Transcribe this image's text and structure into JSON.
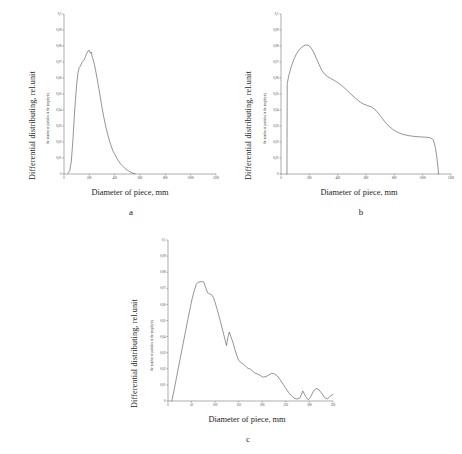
{
  "figure": {
    "background": "#ffffff",
    "line_color": "#3c3c3c",
    "axis_color": "#4a4a4a"
  },
  "panels": [
    {
      "id": "a",
      "letter": "a",
      "outer_ylabel": "Differential distributing, rel.unit",
      "outer_xlabel": "Diameter of piece, mm",
      "inner_ylabel": "the number of particles in the megabyte)"
    },
    {
      "id": "b",
      "letter": "b",
      "outer_ylabel": "Differential distributing, rel.unit",
      "outer_xlabel": "Diameter of piece, mm",
      "inner_ylabel": "the number of particles in the megabyte)"
    },
    {
      "id": "c",
      "letter": "c",
      "outer_ylabel": "Differential distributing, rel.unit",
      "outer_xlabel": "Diameter of piece, mm",
      "inner_ylabel": "the number of particles in the megabyte)"
    }
  ],
  "chart_data": [
    {
      "type": "line",
      "id": "a",
      "title": "",
      "xlabel": "Diameter of piece, mm",
      "ylabel": "Differential distributing, rel.unit",
      "xlim": [
        0,
        1200
      ],
      "ylim": [
        0,
        0.1
      ],
      "xticks": [
        0,
        200,
        400,
        600,
        800,
        1000,
        1200
      ],
      "xticklabels": [
        "0",
        "200",
        "400",
        "600",
        "800",
        "1000",
        "1200"
      ],
      "yticks": [
        0,
        0.01,
        0.02,
        0.03,
        0.04,
        0.05,
        0.06,
        0.07,
        0.08,
        0.09,
        0.1
      ],
      "yticklabels": [
        "0",
        "0,01",
        "0,02",
        "0,03",
        "0,04",
        "0,05",
        "0,06",
        "0,07",
        "0,08",
        "0,09",
        "0,1"
      ],
      "grid": false,
      "legend": false,
      "x": [
        30,
        45,
        58,
        70,
        80,
        90,
        100,
        110,
        120,
        130,
        140,
        150,
        160,
        170,
        180,
        190,
        200,
        208,
        215,
        222,
        230,
        240,
        250,
        262,
        275,
        288,
        300,
        315,
        330,
        345,
        360,
        375,
        390,
        405,
        420,
        440,
        460,
        480,
        500,
        520,
        540,
        560
      ],
      "y": [
        0.0005,
        0.002,
        0.008,
        0.021,
        0.034,
        0.046,
        0.056,
        0.063,
        0.0665,
        0.0675,
        0.0695,
        0.0705,
        0.0715,
        0.0735,
        0.0755,
        0.077,
        0.0772,
        0.0755,
        0.0762,
        0.0735,
        0.0715,
        0.0685,
        0.0645,
        0.0595,
        0.0535,
        0.0475,
        0.0415,
        0.0352,
        0.0295,
        0.0248,
        0.0205,
        0.0168,
        0.0138,
        0.0118,
        0.0095,
        0.007,
        0.0052,
        0.0036,
        0.0024,
        0.0014,
        0.0006,
        0.0002
      ]
    },
    {
      "type": "line",
      "id": "b",
      "title": "",
      "xlabel": "Diameter of piece, mm",
      "ylabel": "Differential distributing, rel.unit",
      "xlim": [
        0,
        1200
      ],
      "ylim": [
        0,
        0.1
      ],
      "xticks": [
        0,
        200,
        400,
        600,
        800,
        1000,
        1200
      ],
      "xticklabels": [
        "0",
        "200",
        "400",
        "600",
        "800",
        "1000",
        "1200"
      ],
      "yticks": [
        0,
        0.01,
        0.02,
        0.03,
        0.04,
        0.05,
        0.06,
        0.07,
        0.08,
        0.09,
        0.1
      ],
      "yticklabels": [
        "0",
        "0,01",
        "0,02",
        "0,03",
        "0,04",
        "0,05",
        "0,06",
        "0,07",
        "0,08",
        "0,09",
        "0,1"
      ],
      "grid": false,
      "legend": false,
      "x": [
        42,
        44,
        55,
        70,
        90,
        110,
        130,
        150,
        170,
        185,
        200,
        215,
        230,
        250,
        270,
        290,
        310,
        330,
        350,
        375,
        400,
        430,
        460,
        490,
        520,
        550,
        580,
        610,
        640,
        670,
        700,
        730,
        760,
        790,
        820,
        860,
        900,
        940,
        980,
        1020,
        1050,
        1075,
        1090,
        1100,
        1108,
        1112
      ],
      "y": [
        0.0,
        0.0565,
        0.0615,
        0.0665,
        0.0715,
        0.0752,
        0.0778,
        0.0795,
        0.0805,
        0.0807,
        0.08,
        0.0785,
        0.0762,
        0.0722,
        0.0682,
        0.0645,
        0.0622,
        0.0608,
        0.0598,
        0.0585,
        0.0572,
        0.0552,
        0.0528,
        0.0502,
        0.0478,
        0.0455,
        0.0438,
        0.0428,
        0.0418,
        0.0398,
        0.0365,
        0.033,
        0.03,
        0.0278,
        0.0262,
        0.0248,
        0.024,
        0.0235,
        0.0232,
        0.023,
        0.0228,
        0.0215,
        0.0165,
        0.0105,
        0.004,
        0.0
      ]
    },
    {
      "type": "line",
      "id": "c",
      "title": "",
      "xlabel": "Diameter of piece, mm",
      "ylabel": "Differential distributing, rel.unit",
      "xlim": [
        0,
        350
      ],
      "ylim": [
        0,
        0.1
      ],
      "xticks": [
        0,
        50,
        100,
        150,
        200,
        250,
        300,
        350
      ],
      "xticklabels": [
        "0",
        "50",
        "100",
        "150",
        "200",
        "250",
        "300",
        "350"
      ],
      "yticks": [
        0,
        0.01,
        0.02,
        0.03,
        0.04,
        0.05,
        0.06,
        0.07,
        0.08,
        0.09,
        0.1
      ],
      "yticklabels": [
        "0",
        "0,01",
        "0,02",
        "0,03",
        "0,04",
        "0,05",
        "0,06",
        "0,07",
        "0,08",
        "0,09",
        "0,1"
      ],
      "grid": false,
      "legend": false,
      "x": [
        8,
        12,
        18,
        24,
        30,
        36,
        42,
        48,
        52,
        56,
        60,
        64,
        68,
        72,
        76,
        80,
        84,
        88,
        92,
        96,
        100,
        104,
        108,
        112,
        116,
        120,
        124,
        127,
        130,
        134,
        138,
        142,
        146,
        150,
        155,
        160,
        165,
        170,
        175,
        180,
        185,
        190,
        196,
        202,
        208,
        214,
        220,
        226,
        232,
        238,
        244,
        250,
        256,
        262,
        268,
        274,
        280,
        286,
        292,
        297,
        302,
        308,
        314,
        320,
        326,
        332,
        338,
        344,
        350
      ],
      "y": [
        0.0,
        0.0055,
        0.0145,
        0.0235,
        0.0325,
        0.0415,
        0.0505,
        0.0592,
        0.0645,
        0.0688,
        0.0725,
        0.0738,
        0.074,
        0.0742,
        0.0738,
        0.0705,
        0.0672,
        0.0665,
        0.0662,
        0.0645,
        0.0612,
        0.0572,
        0.0528,
        0.0485,
        0.0438,
        0.0392,
        0.0345,
        0.0395,
        0.0428,
        0.0395,
        0.0362,
        0.0318,
        0.0282,
        0.0252,
        0.0238,
        0.0228,
        0.0215,
        0.0202,
        0.0198,
        0.0185,
        0.0172,
        0.0168,
        0.0158,
        0.0148,
        0.0152,
        0.0162,
        0.0172,
        0.0168,
        0.0155,
        0.0132,
        0.0105,
        0.0078,
        0.0052,
        0.0032,
        0.0018,
        0.0012,
        0.002,
        0.0062,
        0.0028,
        0.0008,
        0.0022,
        0.0058,
        0.0078,
        0.007,
        0.0048,
        0.0022,
        0.0012,
        0.003,
        0.0042
      ]
    }
  ]
}
